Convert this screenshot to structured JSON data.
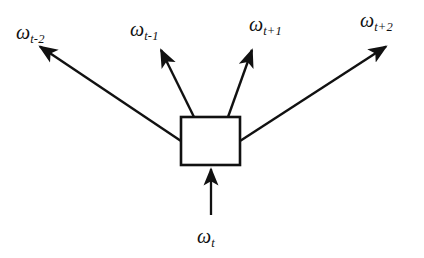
{
  "figure": {
    "type": "node-link-diagram",
    "title": "",
    "background_color": "#ffffff",
    "stroke_color": "#111111",
    "text_color": "#111111"
  },
  "center_node": {
    "name": "projection-box",
    "shape": "rectangle",
    "label": "",
    "fill": "#ffffff",
    "stroke": "#111111",
    "x": 181,
    "y": 117,
    "width": 59,
    "height": 48
  },
  "input": {
    "label_omega": "ω",
    "label_sub": "t",
    "arrow_direction": "up",
    "from": [
      211,
      215
    ],
    "to": [
      211,
      168
    ]
  },
  "outputs": [
    {
      "id": "w-t-minus-2",
      "label_omega": "ω",
      "label_sub": "t-2",
      "label_x": 16,
      "label_y": 22,
      "from": [
        181,
        141
      ],
      "to": [
        38,
        45
      ]
    },
    {
      "id": "w-t-minus-1",
      "label_omega": "ω",
      "label_sub": "t-1",
      "label_x": 130,
      "label_y": 19,
      "from": [
        194,
        117
      ],
      "to": [
        160,
        48
      ]
    },
    {
      "id": "w-t-plus-1",
      "label_omega": "ω",
      "label_sub": "t+1",
      "label_x": 249,
      "label_y": 14,
      "from": [
        228,
        117
      ],
      "to": [
        253,
        48
      ]
    },
    {
      "id": "w-t-plus-2",
      "label_omega": "ω",
      "label_sub": "t+2",
      "label_x": 360,
      "label_y": 10,
      "from": [
        240,
        141
      ],
      "to": [
        388,
        45
      ]
    }
  ]
}
